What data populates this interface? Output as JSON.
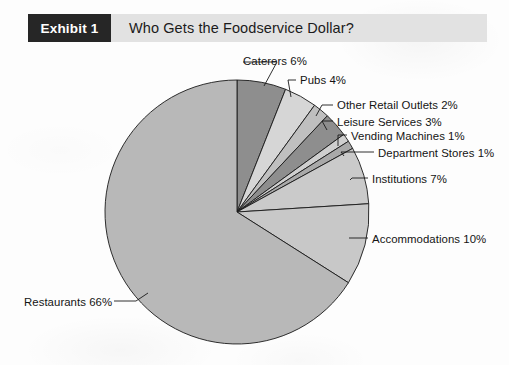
{
  "header": {
    "exhibit_tag": "Exhibit 1",
    "title": "Who Gets the Foodservice Dollar?"
  },
  "chart_data": {
    "type": "pie",
    "title": "Who Gets the Foodservice Dollar?",
    "xlabel": "",
    "ylabel": "",
    "units": "percent",
    "total": 100,
    "start_angle_deg": 0,
    "direction": "clockwise",
    "legend_position": "none",
    "grid": false,
    "categories": [
      "Caterers",
      "Pubs",
      "Other Retail Outlets",
      "Leisure Services",
      "Vending Machines",
      "Department Stores",
      "Institutions",
      "Accommodations",
      "Restaurants"
    ],
    "values": [
      6,
      4,
      2,
      3,
      1,
      1,
      7,
      10,
      66
    ],
    "slices": [
      {
        "name": "Caterers",
        "value": 6,
        "label": "Caterers 6%",
        "color": "#8e8e8e",
        "label_side": "right",
        "label_x": 243,
        "label_y": 56,
        "leader": [
          [
            243,
            62
          ],
          [
            277,
            62
          ],
          [
            277,
            62
          ],
          [
            264,
            86
          ]
        ]
      },
      {
        "name": "Pubs",
        "value": 4,
        "label": "Pubs 4%",
        "color": "#d6d6d6",
        "label_side": "right",
        "label_x": 300,
        "label_y": 75,
        "leader": [
          [
            296,
            80
          ],
          [
            288,
            80
          ],
          [
            288,
            80
          ],
          [
            291,
            97
          ]
        ]
      },
      {
        "name": "Other Retail Outlets",
        "value": 2,
        "label": "Other Retail Outlets 2%",
        "color": "#bfbfbf",
        "label_side": "right",
        "label_x": 337,
        "label_y": 100,
        "leader": [
          [
            333,
            105
          ],
          [
            322,
            105
          ],
          [
            322,
            105
          ],
          [
            316,
            116
          ]
        ]
      },
      {
        "name": "Leisure Services",
        "value": 3,
        "label": "Leisure Services 3%",
        "color": "#8e8e8e",
        "label_side": "right",
        "label_x": 337,
        "label_y": 117,
        "leader": [
          [
            333,
            121
          ],
          [
            322,
            121
          ],
          [
            322,
            121
          ],
          [
            327,
            130
          ]
        ]
      },
      {
        "name": "Vending Machines",
        "value": 1,
        "label": "Vending Machines 1%",
        "color": "#cfcfcf",
        "label_side": "right",
        "label_x": 351,
        "label_y": 131,
        "leader": [
          [
            347,
            135
          ],
          [
            338,
            135
          ],
          [
            338,
            135
          ],
          [
            338,
            146
          ]
        ]
      },
      {
        "name": "Department Stores",
        "value": 1,
        "label": "Department Stores 1%",
        "color": "#a9a9a9",
        "label_side": "right",
        "label_x": 378,
        "label_y": 148,
        "leader": [
          [
            374,
            152
          ],
          [
            341,
            152
          ],
          [
            341,
            152
          ],
          [
            344,
            156
          ]
        ]
      },
      {
        "name": "Institutions",
        "value": 7,
        "label": "Institutions 7%",
        "color": "#cacaca",
        "label_side": "right",
        "label_x": 372,
        "label_y": 174,
        "leader": [
          [
            368,
            178
          ],
          [
            352,
            178
          ],
          [
            352,
            178
          ],
          [
            350,
            180
          ]
        ]
      },
      {
        "name": "Accommodations",
        "value": 10,
        "label": "Accommodations 10%",
        "color": "#c8c8c8",
        "label_side": "right",
        "label_x": 372,
        "label_y": 234,
        "leader": [
          [
            368,
            238
          ],
          [
            349,
            238
          ],
          [
            349,
            238
          ],
          [
            349,
            238
          ]
        ]
      },
      {
        "name": "Restaurants",
        "value": 66,
        "label": "Restaurants 66%",
        "color": "#b8b8b8",
        "label_side": "left",
        "label_x": 24,
        "label_y": 297,
        "leader": [
          [
            114,
            301
          ],
          [
            136,
            301
          ],
          [
            136,
            301
          ],
          [
            148,
            293
          ]
        ]
      }
    ],
    "geometry": {
      "center_x": 237,
      "center_y": 212,
      "radius": 132,
      "outline_color": "#1a1a1a",
      "outline_width": 0.9
    }
  }
}
